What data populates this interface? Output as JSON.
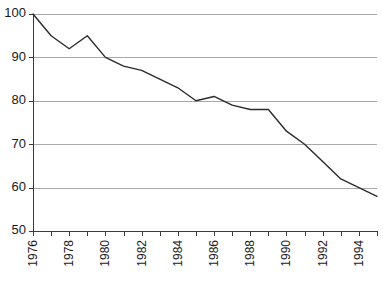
{
  "chart_data": {
    "type": "line",
    "title": "",
    "subtitle": "",
    "xlabel": "",
    "ylabel": "",
    "x": [
      1976,
      1977,
      1978,
      1979,
      1980,
      1981,
      1982,
      1983,
      1984,
      1985,
      1986,
      1987,
      1988,
      1989,
      1990,
      1991,
      1992,
      1993,
      1994,
      1995
    ],
    "values": [
      100,
      95,
      92,
      95,
      90,
      88,
      87,
      85,
      83,
      80,
      81,
      79,
      78,
      78,
      73,
      70,
      66,
      62,
      60,
      58
    ],
    "series": [
      {
        "name": "",
        "values": [
          100,
          95,
          92,
          95,
          90,
          88,
          87,
          85,
          83,
          80,
          81,
          79,
          78,
          78,
          73,
          70,
          66,
          62,
          60,
          58
        ]
      }
    ],
    "ylim": [
      50,
      100
    ],
    "xlim": [
      1976,
      1995
    ],
    "y_ticks": [
      50,
      60,
      70,
      80,
      90,
      100
    ],
    "y_tick_labels": [
      "50",
      "60",
      "70",
      "80",
      "90",
      "100"
    ],
    "x_ticks": [
      1976,
      1977,
      1978,
      1979,
      1980,
      1981,
      1982,
      1983,
      1984,
      1985,
      1986,
      1987,
      1988,
      1989,
      1990,
      1991,
      1992,
      1993,
      1994,
      1995
    ],
    "x_tick_labels": [
      "1976",
      "",
      "1978",
      "",
      "1980",
      "",
      "1982",
      "",
      "1984",
      "",
      "1986",
      "",
      "1988",
      "",
      "1990",
      "",
      "1992",
      "",
      "1994",
      ""
    ],
    "grid": true,
    "grid_axis": "y",
    "legend": false,
    "legend_position": "none",
    "annotations": [],
    "colors": {
      "line": "#2b2b2b",
      "grid": "#a8a8a8",
      "axis": "#3a3a3a",
      "background": "#ffffff",
      "text": "#1a1a1a"
    }
  }
}
